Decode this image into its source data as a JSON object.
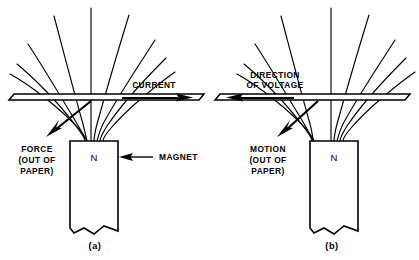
{
  "figure": {
    "background_color": "#ffffff",
    "line_color": "#000000"
  },
  "panels": [
    {
      "id": "a",
      "caption": "(a)",
      "conductor_label": "CURRENT",
      "conductor_arrow_direction": "right",
      "vector_label_lines": [
        "FORCE",
        "(OUT OF",
        "PAPER)"
      ],
      "vector_arrow_direction": "down-left",
      "magnet_pole": "N",
      "magnet_callout": "MAGNET",
      "magnet_callout_arrow_direction": "left",
      "field_line_count": 9
    },
    {
      "id": "b",
      "caption": "(b)",
      "conductor_label_lines": [
        "DIRECTION",
        "OF  VOLTAGE"
      ],
      "conductor_arrow_direction": "left",
      "vector_label_lines": [
        "MOTION",
        "(OUT OF",
        "PAPER)"
      ],
      "vector_arrow_direction": "down-left",
      "magnet_pole": "N",
      "field_line_count": 9
    }
  ]
}
